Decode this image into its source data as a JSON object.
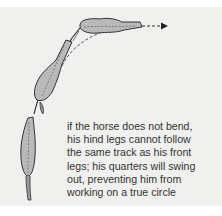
{
  "figure": {
    "caption_lines": [
      "if the horse does not bend,",
      "his hind legs cannot follow",
      "the same track as his front",
      "legs; his quarters will swing",
      "out, preventing him from",
      "working on a true circle"
    ],
    "colors": {
      "background": "#f0f0ef",
      "horse_fill": "#b4b4b4",
      "outline": "#333333",
      "text": "#333333"
    },
    "icons": [
      "horse-front-section",
      "horse-middle-section",
      "horse-hind-section",
      "dashed-path-arrow"
    ]
  }
}
